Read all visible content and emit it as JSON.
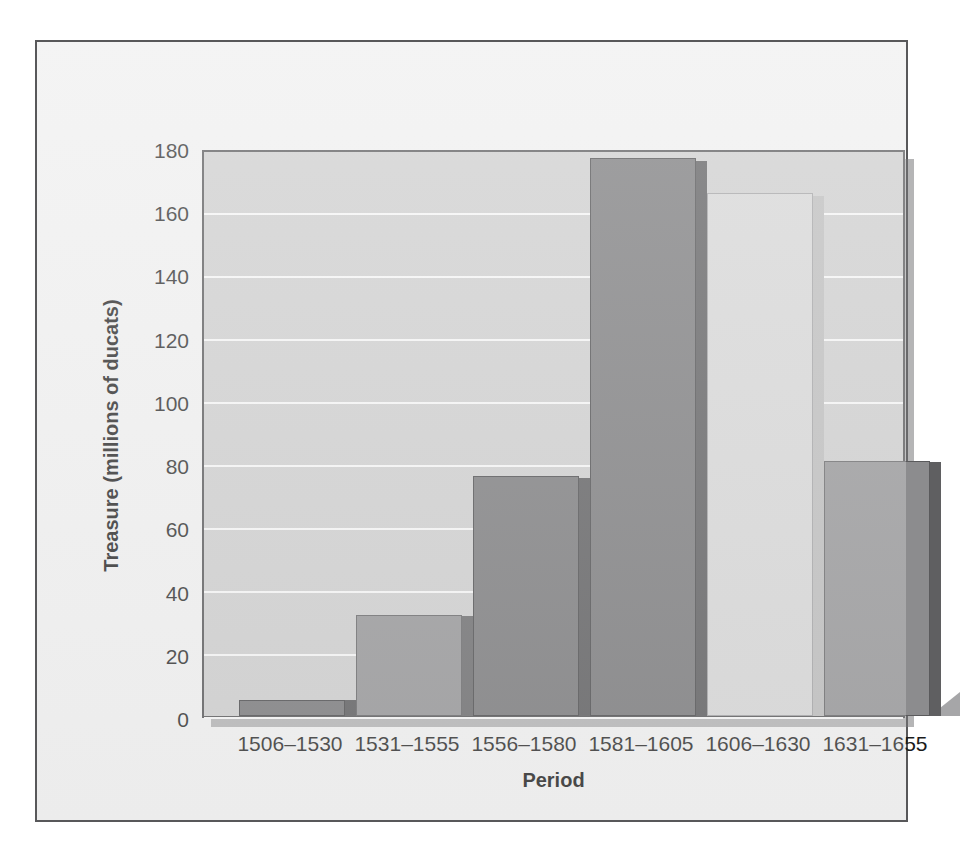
{
  "chart_data": {
    "type": "bar",
    "title": "",
    "xlabel": "Period",
    "ylabel": "Treasure (millions of ducats)",
    "categories": [
      "1506–1530",
      "1531–1555",
      "1556–1580",
      "1581–1605",
      "1606–1630",
      "1631–1655"
    ],
    "values": [
      5,
      32,
      76,
      177,
      166,
      81
    ],
    "ylim": [
      0,
      180
    ],
    "yticks": [
      0,
      20,
      40,
      60,
      80,
      100,
      120,
      140,
      160,
      180
    ],
    "ytick_labels": [
      "0",
      "20",
      "40",
      "60",
      "80",
      "100",
      "120",
      "140",
      "160",
      "180"
    ],
    "grid": "horizontal",
    "legend": "none",
    "bar_colors": [
      "#6e6e70",
      "#8c8c8e",
      "#6e6e70",
      "#6e6e70",
      "#d2d2d2",
      "#8c8c8e"
    ],
    "bar_side_colors": [
      "#4f4f51",
      "#5f5f61",
      "#4f4f51",
      "#4f4f51",
      "#b6b6b6",
      "#5f5f61"
    ],
    "plot_background": "#c9c9c9",
    "gridline_color": "#f4f4f4",
    "figure_background": "#eeeeee",
    "frame_color": "#58585a"
  },
  "axes": {
    "y_title": "Treasure (millions of ducats)",
    "x_title": "Period"
  }
}
